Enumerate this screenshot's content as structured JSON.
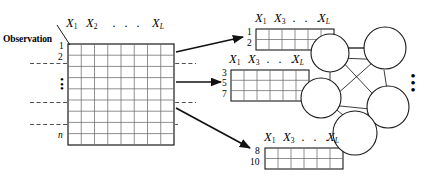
{
  "figure": {
    "type": "diagram"
  },
  "observation_matrix": {
    "corner_label": "Observation",
    "column_headers": [
      "X",
      "X"
    ],
    "column_header_subs": [
      "1",
      "2"
    ],
    "column_dots": "·  ·  ·",
    "last_column_header": "X",
    "last_column_sub": "L",
    "row_labels": {
      "first": "1",
      "second": "2",
      "vertical_dots": "•\n•\n•",
      "last": "n"
    },
    "grid": {
      "rows": 9,
      "cols": 8
    },
    "partition_lines": 3
  },
  "arrows": [
    {
      "name": "arrow-to-subset-1"
    },
    {
      "name": "arrow-to-subset-2"
    },
    {
      "name": "arrow-to-subset-3"
    }
  ],
  "subsets": [
    {
      "id": "subset-1",
      "headers": {
        "first": "X",
        "first_sub": "1",
        "second": "X",
        "second_sub": "3",
        "dots": "· · ·",
        "last": "X",
        "last_sub": "L"
      },
      "row_labels": [
        "1",
        "2"
      ],
      "grid": {
        "rows": 2,
        "cols": 6
      }
    },
    {
      "id": "subset-2",
      "headers": {
        "first": "X",
        "first_sub": "1",
        "second": "X",
        "second_sub": "3",
        "dots": "· · ·",
        "last": "X",
        "last_sub": "L"
      },
      "row_labels": [
        "3",
        "5",
        "7"
      ],
      "grid": {
        "rows": 3,
        "cols": 6
      }
    },
    {
      "id": "subset-3",
      "headers": {
        "first": "X",
        "first_sub": "1",
        "second": "X",
        "second_sub": "3",
        "dots": "· · ·",
        "last": "X",
        "last_sub": "L"
      },
      "row_labels": [
        "8",
        "10"
      ],
      "grid": {
        "rows": 2,
        "cols": 6
      }
    }
  ],
  "network": {
    "node_count": 5,
    "edge_count": 9,
    "ellipsis": "•\n•\n•"
  },
  "colors": {
    "stroke": "#1a1a1a",
    "grid": "#5a5a5a",
    "dashed": "#3c3c3c",
    "background": "#ffffff"
  }
}
